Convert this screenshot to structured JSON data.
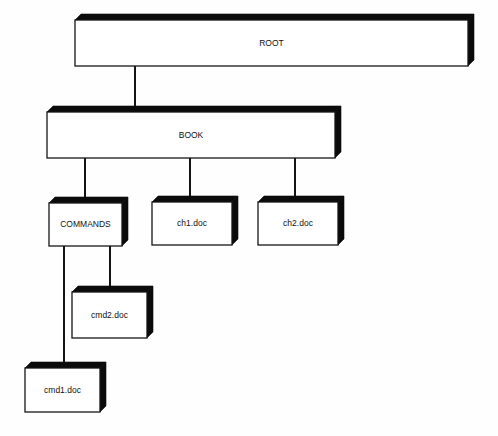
{
  "diagram": {
    "style": {
      "background_color": "#fefefe",
      "box_fill_color": "#ffffff",
      "box_stroke_color": "#161616",
      "box_shade_color": "#0b0b0b",
      "connector_color": "#141414",
      "label_color": "#111111"
    },
    "nodes": [
      {
        "id": "root",
        "label": "ROOT",
        "x": 75,
        "y": 20,
        "width": 393,
        "height": 46,
        "font_size": 8.5,
        "depth": 6
      },
      {
        "id": "book",
        "label": "BOOK",
        "x": 47,
        "y": 112,
        "width": 288,
        "height": 46,
        "font_size": 8.5,
        "depth": 6
      },
      {
        "id": "commands",
        "label": "COMMANDS",
        "x": 49,
        "y": 203,
        "width": 73,
        "height": 43,
        "font_size": 8.5,
        "depth": 6
      },
      {
        "id": "ch1",
        "label": "ch1.doc",
        "x": 152,
        "y": 202,
        "width": 80,
        "height": 43,
        "font_size": 8.5,
        "depth": 6
      },
      {
        "id": "ch2",
        "label": "ch2.doc",
        "x": 258,
        "y": 202,
        "width": 80,
        "height": 43,
        "font_size": 8.5,
        "depth": 6
      },
      {
        "id": "cmd2",
        "label": "cmd2.doc",
        "x": 72,
        "y": 292,
        "width": 75,
        "height": 46,
        "font_size": 8.5,
        "depth": 6
      },
      {
        "id": "cmd1",
        "label": "cmd1.doc",
        "x": 25,
        "y": 368,
        "width": 75,
        "height": 44,
        "font_size": 8.5,
        "depth": 6
      }
    ],
    "connectors": [
      {
        "id": "root-book",
        "from": "root",
        "to": "book",
        "x1": 135,
        "y1": 66,
        "x2": 135,
        "y2": 112
      },
      {
        "id": "book-commands",
        "from": "book",
        "to": "commands",
        "x1": 85,
        "y1": 158,
        "x2": 85,
        "y2": 203
      },
      {
        "id": "book-ch1",
        "from": "book",
        "to": "ch1",
        "x1": 190,
        "y1": 158,
        "x2": 190,
        "y2": 202
      },
      {
        "id": "book-ch2",
        "from": "book",
        "to": "ch2",
        "x1": 295,
        "y1": 158,
        "x2": 295,
        "y2": 202
      },
      {
        "id": "commands-cmd1",
        "from": "commands",
        "to": "cmd1",
        "x1": 64,
        "y1": 246,
        "x2": 64,
        "y2": 368
      },
      {
        "id": "commands-cmd2",
        "from": "commands",
        "to": "cmd2",
        "x1": 110,
        "y1": 246,
        "x2": 110,
        "y2": 292
      }
    ]
  }
}
